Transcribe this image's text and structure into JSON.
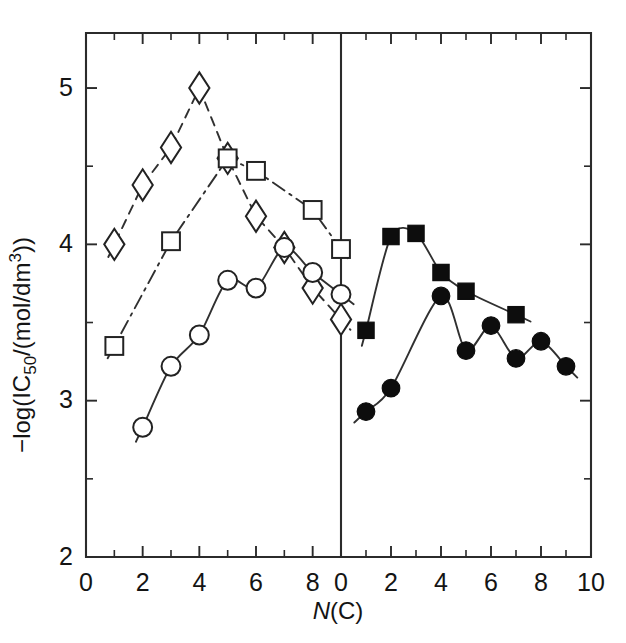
{
  "chart_data": {
    "type": "scatter",
    "title": "",
    "xlabel": "N(C)",
    "ylabel": "-log(IC50/(mol/dm3))",
    "ylabel_parts": {
      "prefix": "−log(IC",
      "sub": "50",
      "mid": "/(mol/dm",
      "sup": "3",
      "suffix": "))"
    },
    "xlabel_parts": {
      "italic": "N",
      "rest": "(C)"
    },
    "grid": false,
    "legend": "none",
    "panels": [
      {
        "name": "left-panel",
        "xlim": [
          0,
          9
        ],
        "ylim": [
          2,
          5.35
        ],
        "xticks_major": [
          0,
          2,
          4,
          6,
          8
        ],
        "xticklabels": [
          "0",
          "2",
          "4",
          "6",
          "8"
        ],
        "xticks_minor": [
          1,
          3,
          5,
          7,
          9
        ],
        "yticks_major": [
          2,
          3,
          4,
          5
        ],
        "yticklabels": [
          "2",
          "3",
          "4",
          "5"
        ],
        "yticks_minor": [
          2.5,
          3.5,
          4.5
        ],
        "series": [
          {
            "name": "open-diamond",
            "marker": "diamond-open",
            "linestyle": "dashed",
            "x": [
              1,
              2,
              3,
              4,
              5,
              6,
              7,
              8,
              9
            ],
            "y": [
              4.0,
              4.38,
              4.62,
              5.0,
              4.55,
              4.18,
              3.98,
              3.72,
              3.52
            ]
          },
          {
            "name": "open-square",
            "marker": "square-open",
            "linestyle": "dashdot",
            "x": [
              1,
              3,
              5,
              6,
              8,
              9
            ],
            "y": [
              3.35,
              4.02,
              4.55,
              4.47,
              4.22,
              3.97
            ]
          },
          {
            "name": "open-circle",
            "marker": "circle-open",
            "linestyle": "solid",
            "x": [
              2,
              3,
              4,
              5,
              6,
              7,
              8,
              9
            ],
            "y": [
              2.83,
              3.22,
              3.42,
              3.77,
              3.72,
              3.98,
              3.82,
              3.68
            ]
          }
        ]
      },
      {
        "name": "right-panel",
        "xlim": [
          0,
          10
        ],
        "ylim": [
          2,
          5.35
        ],
        "xticks_major": [
          0,
          2,
          4,
          6,
          8,
          10
        ],
        "xticklabels": [
          "0",
          "2",
          "4",
          "6",
          "8",
          "10"
        ],
        "xticks_minor": [
          1,
          3,
          5,
          7,
          9
        ],
        "series": [
          {
            "name": "filled-square",
            "marker": "square-filled",
            "linestyle": "solid",
            "x": [
              1,
              2,
              3,
              4,
              5,
              7
            ],
            "y": [
              3.45,
              4.05,
              4.07,
              3.82,
              3.7,
              3.55
            ]
          },
          {
            "name": "filled-circle",
            "marker": "circle-filled",
            "linestyle": "solid",
            "x": [
              1,
              2,
              4,
              5,
              6,
              7,
              8,
              9
            ],
            "y": [
              2.93,
              3.08,
              3.67,
              3.32,
              3.48,
              3.27,
              3.38,
              3.22
            ]
          }
        ]
      }
    ]
  },
  "figure": {
    "background_color": "#ffffff",
    "ink_color": "#1a1a1a",
    "marker_fill_open": "#ffffff",
    "marker_fill_solid": "#0d0d0d"
  }
}
